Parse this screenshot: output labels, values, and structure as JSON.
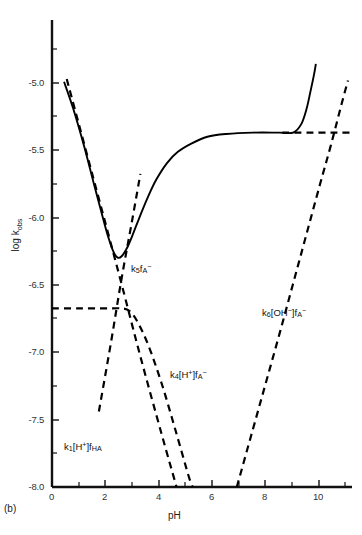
{
  "figure": {
    "panel_label": "(b)"
  },
  "axes": {
    "x": {
      "title": "pH",
      "ticks": [
        "0",
        "2",
        "4",
        "6",
        "8",
        "10"
      ],
      "tick_values": [
        0,
        2,
        4,
        6,
        8,
        10
      ],
      "range": [
        0,
        11.2
      ],
      "minor_step": 1
    },
    "y": {
      "title_prefix": "log k",
      "title_sub": "obs",
      "title": "log k_obs",
      "ticks": [
        "-5.0",
        "-5.5",
        "-6.0",
        "-6.5",
        "-7.0",
        "-7.5",
        "-8.0"
      ],
      "tick_values": [
        -5.0,
        -5.5,
        -6.0,
        -6.5,
        -7.0,
        -7.5,
        -8.0
      ],
      "range": [
        -8.0,
        -4.6
      ]
    }
  },
  "curve_labels": {
    "k5": {
      "base": "k",
      "sub": "5",
      "f": "f",
      "fsub": "A",
      "fsup": "−",
      "text": "k5fA-"
    },
    "k6": {
      "base": "k",
      "sub": "6",
      "mid": "[OH",
      "midsup": "−",
      "midend": "]",
      "f": "f",
      "fsub": "A",
      "fsup": "−",
      "text": "k6[OH-]fA-"
    },
    "k4": {
      "base": "k",
      "sub": "4",
      "mid": "[H",
      "midsup": "+",
      "midend": "]",
      "f": "f",
      "fsub": "A",
      "fsup": "−",
      "text": "k4[H+]fA-"
    },
    "k1": {
      "base": "k",
      "sub": "1",
      "mid": "[H",
      "midsup": "+",
      "midend": "]",
      "f": "f",
      "fsub": "HA",
      "text": "k1[H+]fHA"
    }
  },
  "chart_data": {
    "type": "line",
    "title": "",
    "xlabel": "pH",
    "ylabel": "log k_obs",
    "xlim": [
      0,
      11.2
    ],
    "ylim": [
      -8.0,
      -4.6
    ],
    "grid": false,
    "legend": "inline-annotations",
    "series": [
      {
        "name": "observed",
        "style": "solid",
        "color": "#000000",
        "points": [
          [
            0.45,
            -5.05
          ],
          [
            0.8,
            -5.25
          ],
          [
            1.2,
            -5.52
          ],
          [
            1.6,
            -5.82
          ],
          [
            1.9,
            -6.04
          ],
          [
            2.1,
            -6.18
          ],
          [
            2.3,
            -6.29
          ],
          [
            2.45,
            -6.33
          ],
          [
            2.6,
            -6.32
          ],
          [
            2.8,
            -6.26
          ],
          [
            3.0,
            -6.17
          ],
          [
            3.3,
            -6.02
          ],
          [
            3.6,
            -5.88
          ],
          [
            3.9,
            -5.76
          ],
          [
            4.3,
            -5.64
          ],
          [
            4.7,
            -5.56
          ],
          [
            5.2,
            -5.5
          ],
          [
            5.8,
            -5.45
          ],
          [
            6.5,
            -5.43
          ],
          [
            7.5,
            -5.42
          ],
          [
            8.5,
            -5.42
          ],
          [
            9.0,
            -5.42
          ],
          [
            9.3,
            -5.36
          ],
          [
            9.5,
            -5.25
          ],
          [
            9.65,
            -5.12
          ],
          [
            9.78,
            -5.0
          ],
          [
            9.85,
            -4.92
          ]
        ]
      },
      {
        "name": "k1[H+]fHA",
        "style": "dashed",
        "color": "#000000",
        "points": [
          [
            0.55,
            -5.03
          ],
          [
            1.5,
            -5.72
          ],
          [
            2.5,
            -6.45
          ],
          [
            3.3,
            -7.05
          ],
          [
            4.1,
            -7.62
          ],
          [
            4.65,
            -8.0
          ]
        ]
      },
      {
        "name": "k5fA-",
        "style": "dashed",
        "color": "#000000",
        "points": [
          [
            1.75,
            -7.45
          ],
          [
            2.2,
            -6.95
          ],
          [
            2.6,
            -6.48
          ],
          [
            3.0,
            -6.05
          ],
          [
            3.3,
            -5.72
          ]
        ]
      },
      {
        "name": "k4[H+]fA-",
        "style": "dashed",
        "color": "#000000",
        "points": [
          [
            0.0,
            -6.7
          ],
          [
            1.0,
            -6.7
          ],
          [
            2.0,
            -6.7
          ],
          [
            2.6,
            -6.7
          ],
          [
            2.9,
            -6.72
          ],
          [
            3.2,
            -6.8
          ],
          [
            3.6,
            -6.97
          ],
          [
            4.1,
            -7.25
          ],
          [
            4.6,
            -7.58
          ],
          [
            5.1,
            -7.92
          ],
          [
            5.25,
            -8.0
          ]
        ]
      },
      {
        "name": "k6[OH-]fA-",
        "style": "dashed",
        "color": "#000000",
        "points": [
          [
            6.9,
            -8.0
          ],
          [
            7.5,
            -7.58
          ],
          [
            8.0,
            -7.23
          ],
          [
            8.5,
            -6.88
          ],
          [
            9.0,
            -6.52
          ],
          [
            9.5,
            -6.16
          ],
          [
            10.0,
            -5.8
          ],
          [
            10.4,
            -5.52
          ],
          [
            10.8,
            -5.22
          ],
          [
            11.05,
            -5.04
          ]
        ]
      },
      {
        "name": "k6-plateau",
        "style": "dashed",
        "color": "#000000",
        "points": [
          [
            8.6,
            -5.42
          ],
          [
            9.6,
            -5.42
          ],
          [
            10.5,
            -5.42
          ],
          [
            11.2,
            -5.42
          ]
        ]
      }
    ],
    "annotations": [
      {
        "label": "k5fA-",
        "x": 3.5,
        "y": -6.45
      },
      {
        "label": "k6[OH-]fA-",
        "x": 8.0,
        "y": -6.72
      },
      {
        "label": "k4[H+]fA-",
        "x": 4.6,
        "y": -7.18
      },
      {
        "label": "k1[H+]fHA",
        "x": 1.0,
        "y": -7.72
      }
    ]
  }
}
